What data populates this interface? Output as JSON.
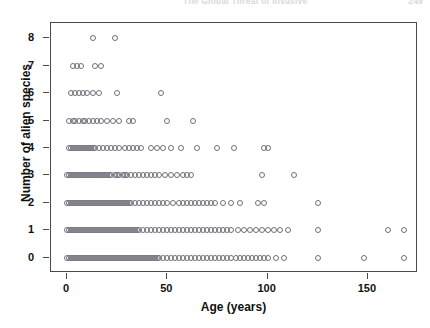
{
  "page_header": {
    "running_title": "The Global Threat of Invasive",
    "page_number": "249"
  },
  "chart_data": {
    "type": "scatter",
    "title": "",
    "xlabel": "Age (years)",
    "ylabel": "Number of alien species",
    "xlim": [
      -8,
      175
    ],
    "ylim": [
      -0.55,
      8.55
    ],
    "xticks": [
      0,
      50,
      100,
      150
    ],
    "yticks": [
      0,
      1,
      2,
      3,
      4,
      5,
      6,
      7,
      8
    ],
    "xticklabels": [
      "0",
      "50",
      "100",
      "150"
    ],
    "yticklabels": [
      "0",
      "1",
      "2",
      "3",
      "4",
      "5",
      "6",
      "7",
      "8"
    ],
    "grid": false,
    "legend": false,
    "marker": "open-circle",
    "marker_color": "#70707a",
    "frame_color": "#4a4a4a",
    "series": [
      {
        "name": "Islands",
        "points_by_y": {
          "8": [
            13,
            24
          ],
          "7": [
            3,
            5,
            7,
            14,
            17
          ],
          "6": [
            2,
            4,
            6,
            8,
            10,
            13,
            16,
            25,
            47
          ],
          "5": [
            1,
            3,
            4,
            6,
            8,
            9,
            11,
            13,
            15,
            17,
            20,
            23,
            26,
            31,
            33,
            50,
            63
          ],
          "4": [
            1,
            2,
            3,
            4,
            5,
            6,
            7,
            8,
            9,
            10,
            11,
            12,
            13,
            14,
            16,
            18,
            20,
            22,
            24,
            26,
            29,
            31,
            33,
            35,
            37,
            42,
            45,
            48,
            52,
            57,
            65,
            75,
            83,
            98,
            100
          ],
          "3": [
            0,
            1,
            2,
            3,
            4,
            5,
            6,
            7,
            8,
            9,
            10,
            11,
            12,
            13,
            14,
            15,
            16,
            17,
            18,
            19,
            20,
            21,
            22,
            24,
            25,
            26,
            28,
            29,
            30,
            32,
            34,
            36,
            38,
            40,
            42,
            44,
            46,
            49,
            52,
            55,
            58,
            60,
            62,
            97,
            113
          ],
          "2": [
            0,
            1,
            2,
            3,
            4,
            5,
            6,
            7,
            8,
            9,
            10,
            11,
            12,
            13,
            14,
            15,
            16,
            17,
            18,
            19,
            20,
            21,
            22,
            23,
            24,
            25,
            26,
            27,
            28,
            29,
            30,
            31,
            32,
            34,
            36,
            38,
            40,
            42,
            44,
            46,
            48,
            50,
            53,
            56,
            58,
            60,
            62,
            64,
            66,
            68,
            70,
            72,
            74,
            78,
            82,
            86,
            95,
            98,
            125
          ],
          "1": [
            0,
            1,
            2,
            3,
            4,
            5,
            6,
            7,
            8,
            9,
            10,
            11,
            12,
            13,
            14,
            15,
            16,
            17,
            18,
            19,
            20,
            21,
            22,
            23,
            24,
            25,
            26,
            27,
            28,
            29,
            30,
            31,
            32,
            33,
            34,
            35,
            36,
            38,
            40,
            42,
            44,
            46,
            48,
            50,
            52,
            54,
            56,
            58,
            60,
            62,
            64,
            66,
            68,
            70,
            72,
            74,
            76,
            78,
            80,
            82,
            85,
            88,
            91,
            94,
            97,
            100,
            103,
            106,
            110,
            125,
            160,
            168
          ],
          "0": [
            0,
            1,
            2,
            3,
            4,
            5,
            6,
            7,
            8,
            9,
            10,
            11,
            12,
            13,
            14,
            15,
            16,
            17,
            18,
            19,
            20,
            21,
            22,
            23,
            24,
            25,
            26,
            27,
            28,
            29,
            30,
            31,
            32,
            33,
            34,
            35,
            36,
            37,
            38,
            39,
            40,
            41,
            42,
            43,
            44,
            45,
            46,
            48,
            50,
            52,
            54,
            56,
            58,
            60,
            62,
            64,
            66,
            68,
            70,
            72,
            74,
            76,
            78,
            80,
            82,
            84,
            86,
            88,
            90,
            92,
            94,
            96,
            98,
            100,
            104,
            108,
            125,
            148,
            168
          ]
        }
      }
    ]
  }
}
